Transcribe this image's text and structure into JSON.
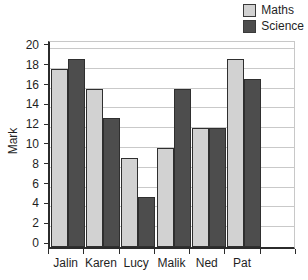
{
  "chart_data": {
    "type": "bar",
    "title": "",
    "subtitle": "",
    "xlabel": "",
    "ylabel": "Mark",
    "categories": [
      "Jalin",
      "Karen",
      "Lucy",
      "Malik",
      "Ned",
      "Pat"
    ],
    "series": [
      {
        "name": "Maths",
        "color": "#d2d2d2",
        "values": [
          18,
          16,
          9,
          10,
          12,
          19
        ]
      },
      {
        "name": "Science",
        "color": "#4d4d4d",
        "values": [
          19,
          13,
          5,
          16,
          12,
          17
        ]
      }
    ],
    "ylim": [
      0,
      21
    ],
    "yticks": [
      0,
      2,
      4,
      6,
      8,
      10,
      12,
      14,
      16,
      18,
      20
    ],
    "ytick_labels": [
      "0",
      "2",
      "4",
      "6",
      "8",
      "10",
      "12",
      "14",
      "16",
      "18",
      "20"
    ],
    "grid": true,
    "grid_axis": "y",
    "legend_position": "top-right",
    "bar_edge_color": "#2f2f2f",
    "axis_color": "#2b2b2b",
    "grid_color": "#c9c9c9",
    "background": "#ffffff"
  },
  "legend": {
    "entries": [
      {
        "label": "Maths",
        "swatch": "maths-swatch"
      },
      {
        "label": "Science",
        "swatch": "science-swatch"
      }
    ]
  },
  "axes": {
    "y_title": "Mark"
  }
}
